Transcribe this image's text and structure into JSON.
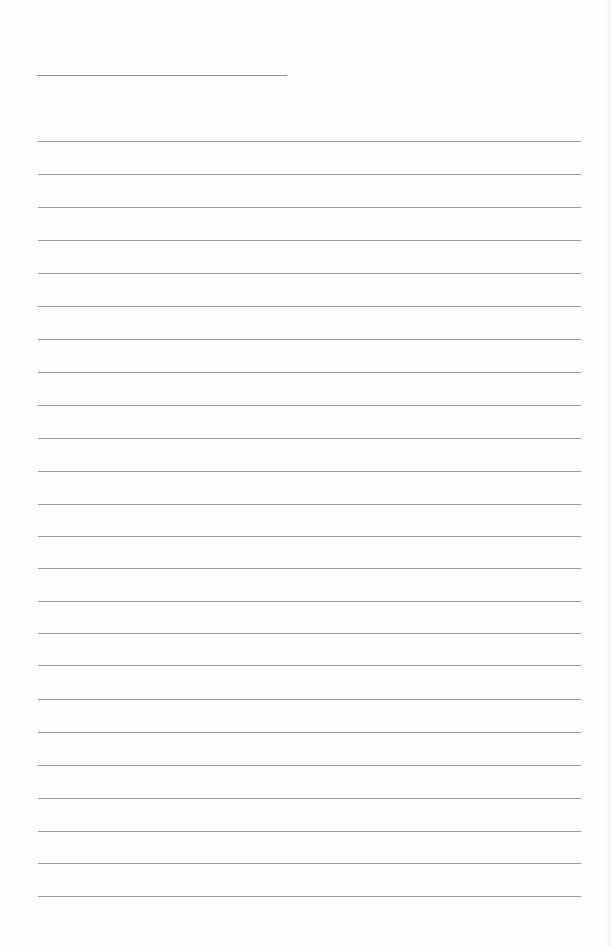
{
  "document": {
    "type": "lined-paper",
    "title_line": {
      "left": 37,
      "top": 75,
      "width": 250
    },
    "rules": {
      "left": 38,
      "width": 543,
      "tops": [
        141,
        174,
        207,
        240,
        273,
        306,
        339,
        372,
        405,
        438,
        471,
        504,
        536,
        568,
        601,
        633,
        665,
        699,
        732,
        765,
        798,
        831,
        863,
        896
      ]
    },
    "colors": {
      "paper": "#fefefe",
      "rule": "#9a9a9a"
    }
  }
}
